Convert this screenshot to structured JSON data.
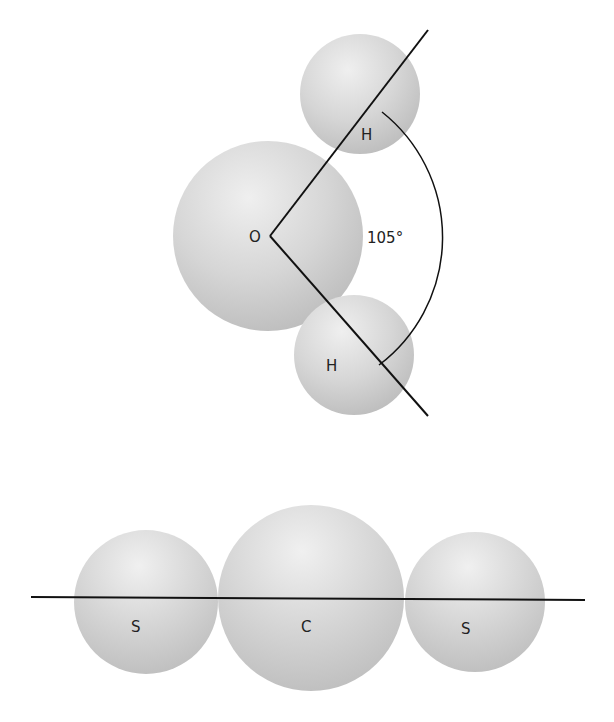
{
  "figure": {
    "water": {
      "molecule": "H2O",
      "geometry": "bent",
      "atoms": [
        {
          "label": "O",
          "role": "central"
        },
        {
          "label": "H",
          "role": "upper"
        },
        {
          "label": "H",
          "role": "lower"
        }
      ],
      "bond_angle_label": "105°"
    },
    "carbon_disulfide": {
      "molecule": "CS2",
      "geometry": "linear",
      "atoms": [
        {
          "label": "S",
          "role": "left"
        },
        {
          "label": "C",
          "role": "central"
        },
        {
          "label": "S",
          "role": "right"
        }
      ]
    }
  },
  "colors": {
    "sphere_light": "#ebebeb",
    "sphere_mid": "#d2d2d2",
    "sphere_dark": "#bdbdbd",
    "line": "#111111",
    "background": "#ffffff"
  }
}
